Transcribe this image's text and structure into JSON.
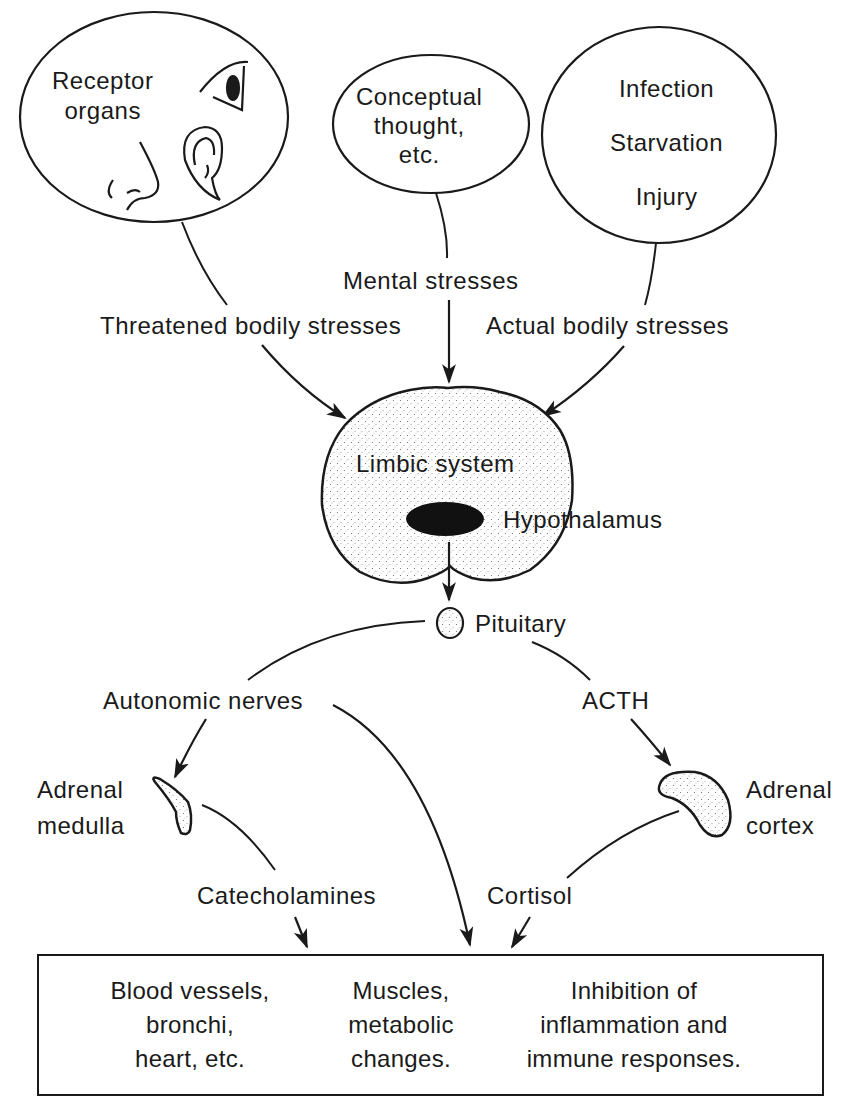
{
  "sources": {
    "receptor": {
      "label_lines": [
        "Receptor",
        "organs"
      ],
      "icons": [
        "eye-icon",
        "ear-icon",
        "nose-icon"
      ]
    },
    "conceptual": {
      "label_lines": [
        "Conceptual",
        "thought,",
        "etc."
      ]
    },
    "physical": {
      "label_lines": [
        "Infection",
        "Starvation",
        "Injury"
      ]
    }
  },
  "pathway_labels": {
    "threatened": "Threatened bodily stresses",
    "mental": "Mental stresses",
    "actual": "Actual bodily stresses"
  },
  "brain": {
    "limbic": "Limbic system",
    "hypothalamus": "Hypothalamus",
    "pituitary": "Pituitary"
  },
  "branches": {
    "autonomic": "Autonomic nerves",
    "acth": "ACTH",
    "medulla_lines": [
      "Adrenal",
      "medulla"
    ],
    "cortex_lines": [
      "Adrenal",
      "cortex"
    ],
    "catecholamines": "Catecholamines",
    "cortisol": "Cortisol"
  },
  "effects": [
    {
      "lines": [
        "Blood vessels,",
        "bronchi,",
        "heart, etc."
      ]
    },
    {
      "lines": [
        "Muscles,",
        "metabolic",
        "changes."
      ]
    },
    {
      "lines": [
        "Inhibition of",
        "inflammation and",
        "immune responses."
      ]
    }
  ],
  "colors": {
    "ink": "#1a1a1a",
    "background": "#ffffff",
    "stipple": "#d9d9d9"
  }
}
